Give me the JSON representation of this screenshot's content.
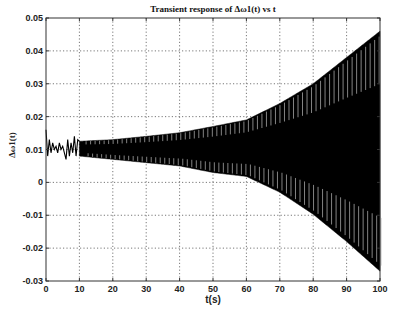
{
  "chart_data": {
    "type": "line",
    "title": "Transient response of Δω1(t) vs t",
    "xlabel": "t(s)",
    "ylabel": "Δω1(t)",
    "xlim": [
      0,
      100
    ],
    "ylim": [
      -0.03,
      0.05
    ],
    "xticks": [
      0,
      10,
      20,
      30,
      40,
      50,
      60,
      70,
      80,
      90,
      100
    ],
    "xtick_labels": [
      "0",
      "10",
      "20",
      "30",
      "40",
      "50",
      "60",
      "70",
      "80",
      "90",
      "100"
    ],
    "yticks": [
      0.05,
      0.04,
      0.03,
      0.02,
      0.01,
      0,
      -0.01,
      -0.02,
      -0.03
    ],
    "ytick_labels": [
      "0.05",
      "0.04",
      "0.03",
      "0.02",
      "0.01",
      "0",
      "-0.01",
      "-0.02",
      "-0.03"
    ],
    "grid": true,
    "legend": null,
    "series": [
      {
        "name": "Δω1(t)",
        "description": "Initial irregular transient (0-10 s) around 0.011, followed by a growing oscillation whose envelope diverges",
        "initial_transient": {
          "t": [
            0,
            0.5,
            1,
            1.5,
            2,
            2.5,
            3,
            3.5,
            4,
            4.5,
            5,
            5.5,
            6,
            6.5,
            7,
            7.5,
            8,
            8.5,
            9,
            9.5,
            10
          ],
          "y": [
            0.016,
            0.008,
            0.013,
            0.009,
            0.012,
            0.01,
            0.011,
            0.009,
            0.012,
            0.01,
            0.011,
            0.009,
            0.007,
            0.013,
            0.008,
            0.012,
            0.009,
            0.014,
            0.008,
            0.013,
            0.0125
          ]
        },
        "envelope_upper": {
          "t": [
            10,
            20,
            30,
            40,
            50,
            60,
            70,
            80,
            90,
            100
          ],
          "y": [
            0.0125,
            0.013,
            0.014,
            0.0151,
            0.017,
            0.019,
            0.024,
            0.03,
            0.038,
            0.046
          ]
        },
        "envelope_lower": {
          "t": [
            10,
            20,
            30,
            40,
            50,
            60,
            70,
            80,
            90,
            100
          ],
          "y": [
            0.008,
            0.007,
            0.006,
            0.005,
            0.003,
            0.0018,
            -0.003,
            -0.0097,
            -0.018,
            -0.027
          ]
        }
      }
    ]
  },
  "layout": {
    "plot_left": 46,
    "plot_top": 18,
    "plot_right": 380,
    "plot_bottom": 281,
    "line_color": "#000000",
    "highlight_color": "#bbbbbb"
  }
}
